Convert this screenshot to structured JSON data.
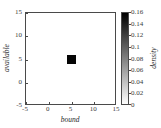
{
  "chart_data": {
    "type": "heatmap",
    "title": "",
    "xlabel": "bound",
    "ylabel": "available",
    "xlim": [
      -5,
      15
    ],
    "ylim": [
      -5,
      15
    ],
    "xticks": [
      -5,
      0,
      5,
      10,
      15
    ],
    "yticks": [
      -5,
      0,
      5,
      10,
      15
    ],
    "xticklabels": [
      "-5",
      "0",
      "5",
      "10",
      "15"
    ],
    "yticklabels": [
      "-5",
      "0",
      "5",
      "10",
      "15"
    ],
    "grid": false,
    "cells": [
      {
        "x": 5,
        "y": 5,
        "width": 2,
        "height": 2,
        "value": 0.16,
        "color": "#050505"
      }
    ],
    "colorbar": {
      "label": "density",
      "vmin": 0,
      "vmax": 0.16,
      "ticks": [
        0.16,
        0.14,
        0.12,
        0.1,
        0.08,
        0.06,
        0.04,
        0.02,
        0
      ],
      "ticklabels": [
        "0.16",
        "0.14",
        "0.12",
        "0.1",
        "0.08",
        "0.06",
        "0.04",
        "0.02",
        "0"
      ],
      "colormap": "grayscale-reversed",
      "top_color": "#000000",
      "bottom_color": "#ffffff",
      "orientation": "vertical"
    },
    "colors": {
      "background": "#ffffff",
      "axis": "#4a4a4a",
      "text": "#2a2a2a",
      "data": "#050505"
    }
  }
}
